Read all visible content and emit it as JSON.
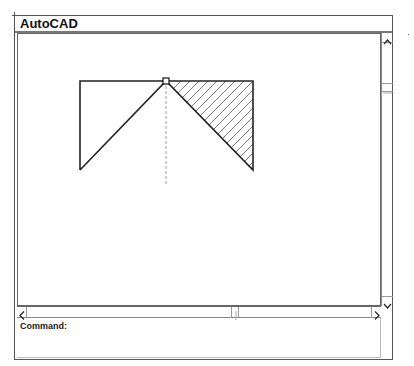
{
  "window": {
    "title": "AutoCAD"
  },
  "command_line": {
    "label": "Command:",
    "value": ""
  },
  "scrollbars": {
    "vertical": {
      "up_icon": "chevron-up-icon",
      "down_icon": "chevron-down-icon"
    },
    "horizontal": {
      "left_icon": "chevron-left-icon",
      "right_icon": "chevron-right-icon"
    }
  },
  "drawing": {
    "outline": [
      [
        79,
        80
      ],
      [
        252,
        80
      ],
      [
        252,
        169
      ],
      [
        165,
        80
      ],
      [
        79,
        169
      ],
      [
        79,
        80
      ]
    ],
    "hatched_region": [
      [
        165,
        80
      ],
      [
        252,
        80
      ],
      [
        252,
        169
      ]
    ],
    "centerline": {
      "x": 165,
      "y1": 80,
      "y2": 183
    },
    "grip_point": {
      "x": 165,
      "y": 80
    },
    "line_color": "#222222",
    "hatch_color": "#555555",
    "centerline_color": "#888888"
  }
}
